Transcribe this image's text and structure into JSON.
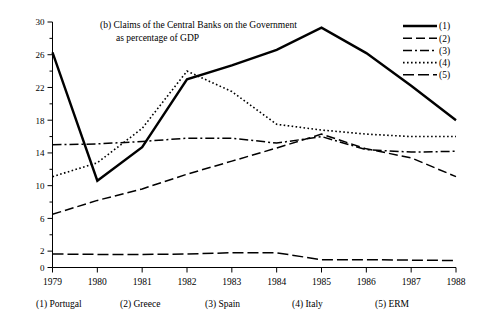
{
  "chart_data": {
    "type": "line",
    "title": "(b)  Claims of the Central Banks on the Government",
    "subtitle": "as percentage of GDP",
    "xlabel": "",
    "ylabel": "",
    "x": [
      1979,
      1980,
      1981,
      1982,
      1983,
      1984,
      1985,
      1986,
      1987,
      1988
    ],
    "xtick_labels": [
      "1979",
      "1980",
      "1981",
      "1982",
      "1983",
      "1984",
      "1985",
      "1986",
      "1987",
      "1988"
    ],
    "ytick_labels": [
      "0",
      "2",
      "6",
      "10",
      "14",
      "18",
      "22",
      "26",
      "30"
    ],
    "ytick_values": [
      0,
      2,
      6,
      10,
      14,
      18,
      22,
      26,
      30
    ],
    "yminor_values": [
      4,
      8,
      12,
      16,
      20,
      24,
      28
    ],
    "ylim": [
      0,
      30
    ],
    "xlim": [
      1979,
      1988
    ],
    "grid": false,
    "legend_position": "top-right",
    "series": [
      {
        "name": "(1)",
        "label": "Portugal",
        "style": "solid",
        "values": [
          26.3,
          10.6,
          14.7,
          23.0,
          24.7,
          26.6,
          29.3,
          26.2,
          22.2,
          18.0
        ]
      },
      {
        "name": "(2)",
        "label": "Greece",
        "style": "dashed",
        "values": [
          6.5,
          8.2,
          9.6,
          11.4,
          13.0,
          14.6,
          16.3,
          14.5,
          13.4,
          11.1
        ]
      },
      {
        "name": "(3)",
        "label": "Spain",
        "style": "dash-dot",
        "values": [
          15.0,
          15.1,
          15.4,
          15.8,
          15.8,
          15.2,
          16.0,
          14.4,
          14.1,
          14.2
        ]
      },
      {
        "name": "(4)",
        "label": "Italy",
        "style": "dotted",
        "values": [
          11.1,
          12.8,
          17.0,
          24.0,
          21.5,
          17.5,
          16.8,
          16.3,
          16.0,
          16.0
        ]
      },
      {
        "name": "(5)",
        "label": "ERM",
        "style": "long-dash",
        "values": [
          1.65,
          1.6,
          1.6,
          1.65,
          1.8,
          1.8,
          0.95,
          0.95,
          0.9,
          0.85
        ]
      }
    ],
    "legend_entries": [
      {
        "marker": "solid",
        "label": "(1)"
      },
      {
        "marker": "dashed",
        "label": "(2)"
      },
      {
        "marker": "dash-dot",
        "label": "(3)"
      },
      {
        "marker": "dotted",
        "label": "(4)"
      },
      {
        "marker": "long-dash",
        "label": "(5)"
      }
    ],
    "footer_entries": [
      {
        "key": "(1)",
        "name": "Portugal"
      },
      {
        "key": "(2)",
        "name": "Greece"
      },
      {
        "key": "(3)",
        "name": "Spain"
      },
      {
        "key": "(4)",
        "name": "Italy"
      },
      {
        "key": "(5)",
        "name": "ERM"
      }
    ],
    "colors": {
      "line": "#000000",
      "axis": "#000000",
      "background": "#ffffff"
    }
  }
}
